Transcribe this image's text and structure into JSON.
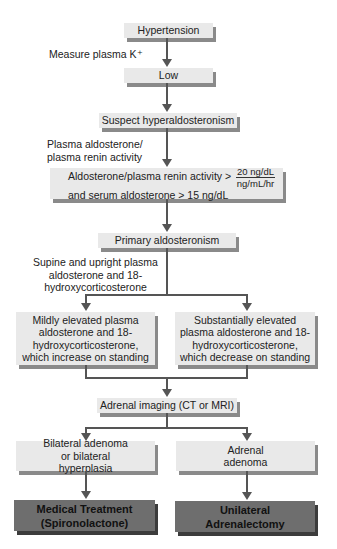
{
  "nodes": {
    "hypertension": "Hypertension",
    "low": "Low",
    "suspect": "Suspect hyperaldosteronism",
    "ratio_line1": "Aldosterone/plasma renin activity >",
    "ratio_line2": "and serum aldosterone > 15 ng/dL",
    "ratio_frac_num": "20 ng/dL",
    "ratio_frac_den": "ng/mL/hr",
    "primary": "Primary aldosteronism",
    "mild": "Mildly elevated plasma aldosterone and 18-hydroxycorticosterone, which increase on standing",
    "substantial": "Substantially elevated plasma aldosterone and 18-hydroxycorticosterone, which decrease on standing",
    "imaging": "Adrenal imaging (CT or MRI)",
    "bilateral": "Bilateral adenoma or bilateral hyperplasia",
    "adenoma": "Adrenal adenoma",
    "medical": "Medical Treatment (Spironolactone)",
    "surgery": "Unilateral Adrenalectomy"
  },
  "edge_labels": {
    "measure_k": "Measure plasma K⁺",
    "plasma_ratio": "Plasma aldosterone/ plasma renin activity",
    "supine": "Supine and upright plasma aldosterone and 18-hydroxycorticosterone"
  },
  "colors": {
    "box_fill": "#e9e9e9",
    "box_shadow": "#8a8a8a",
    "terminal_fill": "#6e6e6e",
    "terminal_shadow": "#3c3c3c",
    "arrow": "#555555"
  }
}
